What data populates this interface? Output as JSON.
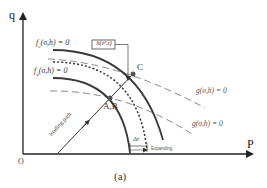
{
  "diagram": {
    "caption": "(a)",
    "axes": {
      "x_label": "P",
      "y_label": "q",
      "origin_label": "O"
    },
    "curves": {
      "fc_label": "f",
      "fc_sub": "c",
      "fc_args": "(σ,h) = 0",
      "fd_label": "f",
      "fd_sub": "d",
      "fd_args": "(σ,h) = 0",
      "g_upper_label": "g(σ,h) = 0",
      "g_lower_label": "g(σ,h) = 0"
    },
    "points": {
      "c_label": "C",
      "ab_label": "A,B"
    },
    "annotations": {
      "h_box_label": "h(εᵖ,t)",
      "loading_path_label": "loading path",
      "delta_r_label": "Δr",
      "expanding_label": "Expanding"
    },
    "colors": {
      "solid_curve": "#3a3a3a",
      "dashed_curve": "#8a8a8a",
      "point_fill": "#555555",
      "axis": "#222222"
    }
  }
}
